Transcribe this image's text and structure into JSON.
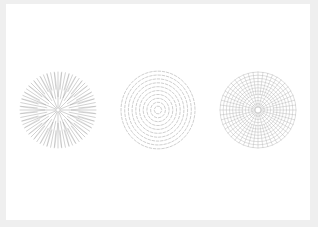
{
  "artwork": {
    "background": "#ffffff",
    "frame_color": "#efefef",
    "stroke_color": "#9a9a9a",
    "patterns": [
      {
        "name": "radial-lines",
        "cx": 58,
        "cy": 110,
        "r": 38
      },
      {
        "name": "concentric-dashes",
        "cx": 158,
        "cy": 110,
        "r": 37
      },
      {
        "name": "radial-grid",
        "cx": 258,
        "cy": 110,
        "r": 38
      }
    ]
  }
}
